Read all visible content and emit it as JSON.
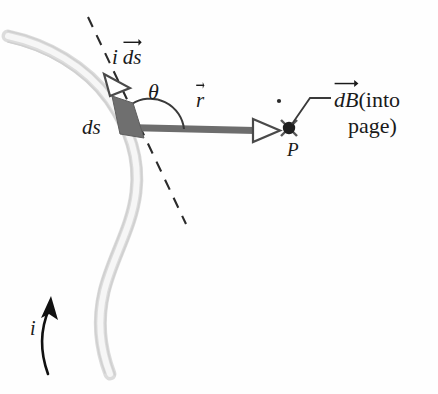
{
  "figure": {
    "name": "biot-savart-law-diagram",
    "background_color": "#fefefe"
  },
  "colors": {
    "wire": "#e2e2e2",
    "wire_edge": "#cfcfcf",
    "element_fill": "#6f6f6f",
    "r_vector": "#6d6d6d",
    "ink": "#1a1a1a",
    "dashed_line": "#2a2a2a"
  },
  "labels": {
    "current_element": {
      "prefix": "i",
      "vector_base": "ds",
      "text": "i ds"
    },
    "angle": {
      "text": "θ",
      "name": "theta"
    },
    "r_vector": {
      "vector_base": "r",
      "text": "r"
    },
    "ds_segment": {
      "text": "ds"
    },
    "field_point": {
      "text": "P"
    },
    "dB": {
      "vector_base": "dB",
      "line1_suffix": "(into",
      "line2": "page)",
      "text": "dB (into page)"
    },
    "current": {
      "text": "i"
    }
  },
  "elements": {
    "wire": "current-carrying-wire",
    "dashed_tangent": "tangent-dashed-line",
    "ds_element": "current-element-segment",
    "ids_arrowhead": "ids-direction-arrowhead",
    "r_arrow": "r-vector-arrow",
    "theta_arc": "theta-angle-arc",
    "point_marker": "point-P-into-page-marker",
    "leader_line": "dB-leader-line",
    "current_arrow": "current-direction-arrow",
    "stray_dot": "stray-dot"
  }
}
